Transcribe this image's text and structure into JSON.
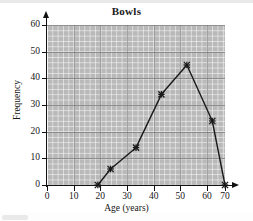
{
  "chart_data": {
    "type": "line",
    "title": "Bowls",
    "xlabel": "Age (years)",
    "ylabel": "Frequency",
    "x": [
      20,
      25,
      35,
      45,
      55,
      65,
      70
    ],
    "values": [
      0,
      6,
      14,
      34,
      45,
      24,
      0
    ],
    "series": [
      {
        "name": "Bowls",
        "points": [
          {
            "x": 20,
            "y": 0
          },
          {
            "x": 25,
            "y": 6
          },
          {
            "x": 35,
            "y": 14
          },
          {
            "x": 45,
            "y": 34
          },
          {
            "x": 55,
            "y": 45
          },
          {
            "x": 65,
            "y": 24
          },
          {
            "x": 70,
            "y": 0
          }
        ]
      }
    ],
    "xlim": [
      0,
      70
    ],
    "ylim": [
      0,
      60
    ],
    "xticks": [
      0,
      10,
      20,
      30,
      40,
      50,
      60,
      70
    ],
    "yticks": [
      0,
      10,
      20,
      30,
      40,
      50,
      60
    ],
    "grid": true,
    "legend": "none",
    "marker": "star-cross",
    "line_color": "#1a1a1a",
    "plot_background": "#b9b9b9",
    "grid_color": "#ffffff",
    "major_grid_color": "#6d6d6d"
  },
  "figure": {
    "title": "Bowls",
    "x_axis_title": "Age (years)",
    "y_axis_title": "Frequency",
    "x_tick_labels": [
      "0",
      "10",
      "20",
      "30",
      "40",
      "50",
      "60",
      "70"
    ],
    "y_tick_labels": [
      "0",
      "10",
      "20",
      "30",
      "40",
      "50",
      "60"
    ]
  }
}
